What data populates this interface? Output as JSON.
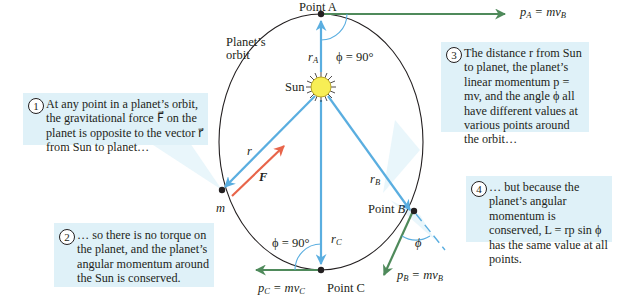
{
  "figure": {
    "orbit_label": [
      "Planet’s",
      "orbit"
    ],
    "sun_label": "Sun",
    "planet_label": "m",
    "points": {
      "A": {
        "label": "Point A",
        "phi": "ϕ = 90°",
        "r": "r",
        "r_sub": "A",
        "p": "p",
        "p_sub": "A",
        "p_rhs": "= mv",
        "p_rhs_sub": "B"
      },
      "B": {
        "label": "Point B",
        "phi": "ϕ",
        "r": "r",
        "r_sub": "B",
        "p": "p",
        "p_sub": "B",
        "p_rhs": "= mv",
        "p_rhs_sub": "B"
      },
      "C": {
        "label": "Point C",
        "phi": "ϕ = 90°",
        "r": "r",
        "r_sub": "C",
        "p": "p",
        "p_sub": "C",
        "p_rhs": "= mv",
        "p_rhs_sub": "C"
      }
    },
    "vectors": {
      "r": "r⃗",
      "F": "F⃗"
    },
    "colors": {
      "orbit": "#231f20",
      "radius": "#5aaee0",
      "momentum": "#4f8a5b",
      "force": "#e8654a",
      "callout_bg": "#dff1f8",
      "sun_fill": "#f7ee55"
    }
  },
  "callouts": [
    {
      "number": "1",
      "text": "At any point in a planet’s orbit, the gravitational force F⃗ on the planet is opposite to the vector r⃗ from Sun to planet…"
    },
    {
      "number": "2",
      "text": "… so there is no torque on the planet, and the planet’s angular momentum around the Sun is conserved."
    },
    {
      "number": "3",
      "text": "The distance r from Sun to planet, the planet’s linear momentum p = mv, and the angle ϕ all have different values at various points around the orbit…"
    },
    {
      "number": "4",
      "text": "… but because the planet’s angular momentum is conserved, L = rp sin ϕ has the same value at all points."
    }
  ]
}
